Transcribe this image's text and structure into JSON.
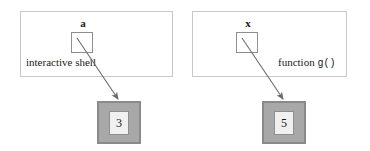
{
  "diagram": {
    "background_color": "#ffffff",
    "frames": [
      {
        "id": "shell",
        "label": "interactive shell",
        "variable_name": "a",
        "value": "3"
      },
      {
        "id": "func",
        "label": "function g()",
        "label_prefix": "function ",
        "label_call": "g()",
        "variable_name": "x",
        "value": "5"
      }
    ],
    "colors": {
      "frame_border": "#c9c9c9",
      "box_border": "#8e8e8e",
      "value_fill": "#a8a8a8",
      "value_border": "#8a8a8a",
      "value_inner_fill": "#f0f0f0",
      "arrow": "#6b6b6b",
      "text": "#1a1a1a"
    },
    "arrows": [
      {
        "id": "arrow-a-to-3",
        "from": "varbox-a",
        "to": "valuebox-3"
      },
      {
        "id": "arrow-x-to-5",
        "from": "varbox-x",
        "to": "valuebox-5"
      }
    ]
  }
}
